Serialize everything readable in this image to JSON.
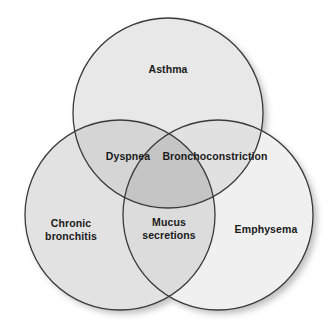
{
  "diagram": {
    "type": "venn",
    "set_count": 3,
    "background_color": "#ffffff",
    "stroke_color": "#3a3a3a",
    "text_color": "#1a1a1a",
    "sets": [
      {
        "id": "asthma",
        "label": "Asthma",
        "position": "top",
        "fill_color": "#e8e8e8",
        "center_x": 168,
        "center_y": 113,
        "radius": 95,
        "label_x": 168,
        "label_y": 69
      },
      {
        "id": "chronic-bronchitis",
        "label": "Chronic\nbronchitis",
        "position": "bottom-left",
        "fill_color": "#e2e2e2",
        "center_x": 120,
        "center_y": 215,
        "radius": 95,
        "label_x": 71,
        "label_y": 229
      },
      {
        "id": "emphysema",
        "label": "Emphysema",
        "position": "bottom-right",
        "fill_color": "#f0f0f0",
        "center_x": 218,
        "center_y": 215,
        "radius": 95,
        "label_x": 266,
        "label_y": 229
      }
    ],
    "intersections": [
      {
        "id": "asthma-bronchitis",
        "label": "Dyspnea",
        "sets": [
          "asthma",
          "chronic-bronchitis"
        ],
        "fill_color": "#d5d5d5",
        "label_x": 128,
        "label_y": 156
      },
      {
        "id": "asthma-emphysema",
        "label": "Bronchoconstriction",
        "sets": [
          "asthma",
          "emphysema"
        ],
        "fill_color": "#e4e4e4",
        "label_x": 215,
        "label_y": 156
      },
      {
        "id": "all-three",
        "label": "Mucus\nsecretions",
        "sets": [
          "asthma",
          "chronic-bronchitis",
          "emphysema"
        ],
        "fill_color": "#c5c5c5",
        "label_x": 169,
        "label_y": 228
      }
    ]
  }
}
